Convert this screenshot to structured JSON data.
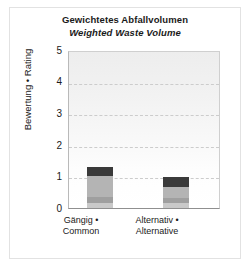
{
  "chart_data": {
    "type": "bar",
    "subtype": "stacked-column",
    "title": "Gewichtetes Abfallvolumen",
    "subtitle": "Weighted Waste Volume",
    "xlabel": "",
    "ylabel": "Bewertung • Rating",
    "ylim": [
      0,
      5
    ],
    "yticks": [
      0,
      1,
      2,
      3,
      4,
      5
    ],
    "ytick_labels": [
      "0",
      "1",
      "2",
      "3",
      "4",
      "5"
    ],
    "grid": true,
    "grid_style": "dashed-horizontal",
    "legend": false,
    "categories": [
      "Gängig • Common",
      "Alternativ • Alternative"
    ],
    "category_lines": [
      [
        "Gängig •",
        "Common"
      ],
      [
        "Alternativ •",
        "Alternative"
      ]
    ],
    "series": [
      {
        "name": "Segment 1",
        "color": "#c9c9c9",
        "values": [
          0.16,
          0.16
        ]
      },
      {
        "name": "Segment 2",
        "color": "#9f9f9f",
        "values": [
          0.19,
          0.16
        ]
      },
      {
        "name": "Segment 3",
        "color": "#b4b4b4",
        "values": [
          0.67,
          0.35
        ]
      },
      {
        "name": "Segment 4",
        "color": "#3a3a3a",
        "values": [
          0.28,
          0.31
        ]
      }
    ],
    "totals": [
      1.3,
      0.98
    ]
  },
  "colors": {
    "plot_background_top": "#ededed",
    "plot_background_bottom": "#ffffff",
    "gridline": "#cccccc",
    "axis": "#8f8f8f",
    "frame": "#e2e2e2",
    "text": "#1a1a1a"
  }
}
